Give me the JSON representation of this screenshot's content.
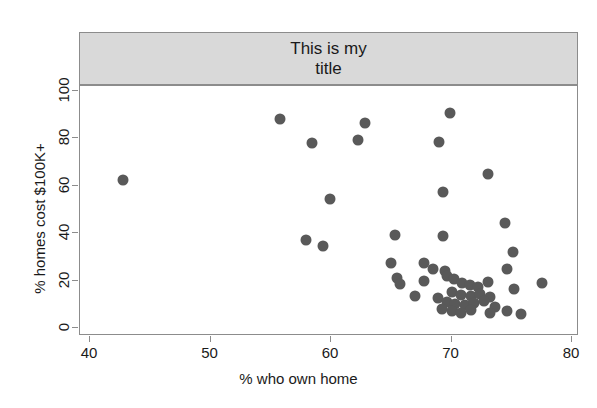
{
  "chart_data": {
    "type": "scatter",
    "title": "This is my\ntitle",
    "title_lines": [
      "This is my",
      "title"
    ],
    "xlabel": "% who own home",
    "ylabel": "% homes cost $100K+",
    "xlim": [
      40,
      80
    ],
    "ylim": [
      0,
      104
    ],
    "xticks": [
      40,
      50,
      60,
      70,
      80
    ],
    "yticks": [
      0,
      20,
      40,
      60,
      80,
      100
    ],
    "grid": false,
    "legend": null,
    "point_color": "#595959",
    "strip_color": "#d9d9d9",
    "axis_color": "#8c8c8c",
    "points": [
      {
        "x": 42.7,
        "y": 62.4
      },
      {
        "x": 55.8,
        "y": 88.3
      },
      {
        "x": 58.4,
        "y": 78.2
      },
      {
        "x": 62.2,
        "y": 79.2
      },
      {
        "x": 62.8,
        "y": 86.6
      },
      {
        "x": 69.9,
        "y": 90.9
      },
      {
        "x": 69.0,
        "y": 78.5
      },
      {
        "x": 73.0,
        "y": 64.9
      },
      {
        "x": 59.9,
        "y": 54.3
      },
      {
        "x": 69.3,
        "y": 57.4
      },
      {
        "x": 74.4,
        "y": 44.3
      },
      {
        "x": 65.3,
        "y": 39.1
      },
      {
        "x": 69.3,
        "y": 39.0
      },
      {
        "x": 57.9,
        "y": 37.0
      },
      {
        "x": 59.3,
        "y": 34.8
      },
      {
        "x": 75.1,
        "y": 32.1
      },
      {
        "x": 65.0,
        "y": 27.3
      },
      {
        "x": 67.7,
        "y": 27.5
      },
      {
        "x": 68.5,
        "y": 25.0
      },
      {
        "x": 69.5,
        "y": 24.0
      },
      {
        "x": 74.6,
        "y": 25.0
      },
      {
        "x": 65.5,
        "y": 21.0
      },
      {
        "x": 65.7,
        "y": 18.5
      },
      {
        "x": 67.7,
        "y": 20.0
      },
      {
        "x": 69.6,
        "y": 21.8
      },
      {
        "x": 70.2,
        "y": 20.5
      },
      {
        "x": 70.9,
        "y": 19.0
      },
      {
        "x": 71.5,
        "y": 18.0
      },
      {
        "x": 72.2,
        "y": 17.5
      },
      {
        "x": 73.0,
        "y": 19.5
      },
      {
        "x": 77.5,
        "y": 19.0
      },
      {
        "x": 75.2,
        "y": 16.5
      },
      {
        "x": 70.0,
        "y": 15.0
      },
      {
        "x": 70.8,
        "y": 14.0
      },
      {
        "x": 71.6,
        "y": 13.5
      },
      {
        "x": 72.4,
        "y": 14.5
      },
      {
        "x": 73.2,
        "y": 13.0
      },
      {
        "x": 68.9,
        "y": 12.5
      },
      {
        "x": 69.6,
        "y": 11.0
      },
      {
        "x": 70.3,
        "y": 10.0
      },
      {
        "x": 71.1,
        "y": 9.5
      },
      {
        "x": 71.9,
        "y": 10.5
      },
      {
        "x": 72.7,
        "y": 11.5
      },
      {
        "x": 73.6,
        "y": 9.0
      },
      {
        "x": 69.2,
        "y": 8.0
      },
      {
        "x": 70.0,
        "y": 7.0
      },
      {
        "x": 70.8,
        "y": 6.5
      },
      {
        "x": 71.6,
        "y": 7.5
      },
      {
        "x": 74.6,
        "y": 7.0
      },
      {
        "x": 75.8,
        "y": 6.0
      },
      {
        "x": 73.2,
        "y": 6.5
      },
      {
        "x": 67.0,
        "y": 13.5
      }
    ]
  }
}
